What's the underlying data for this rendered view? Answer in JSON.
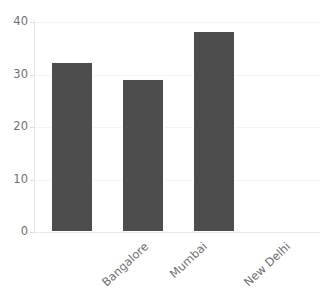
{
  "chart_data": {
    "type": "bar",
    "title": "",
    "xlabel": "",
    "ylabel": "",
    "categories": [
      "Bangalore",
      "Mumbai",
      "New Delhi"
    ],
    "values": [
      32.3,
      29.1,
      38.2
    ],
    "ylim": [
      0,
      40
    ],
    "yticks": [
      0,
      10,
      20,
      30,
      40
    ],
    "ytick_labels": [
      "0",
      "10",
      "20",
      "30",
      "40"
    ],
    "grid": true,
    "grid_axis": "y",
    "legend": false,
    "legend_position": "none",
    "xtick_rotation": -43,
    "series": [
      {
        "name": "",
        "color": "#4d4d4d",
        "values": [
          32.3,
          29.1,
          38.2
        ]
      }
    ]
  },
  "colors": {
    "bar": "#4d4d4d",
    "bar_edge": "#fdfdfd",
    "grid": "#f4f4f6",
    "axis": "#e6e6ea",
    "baseline": "#e9e9ed",
    "tick": "#dcdce0",
    "tick_label": "#6f6f74",
    "background": "#ffffff"
  },
  "title_sliver": {
    "text": ""
  }
}
